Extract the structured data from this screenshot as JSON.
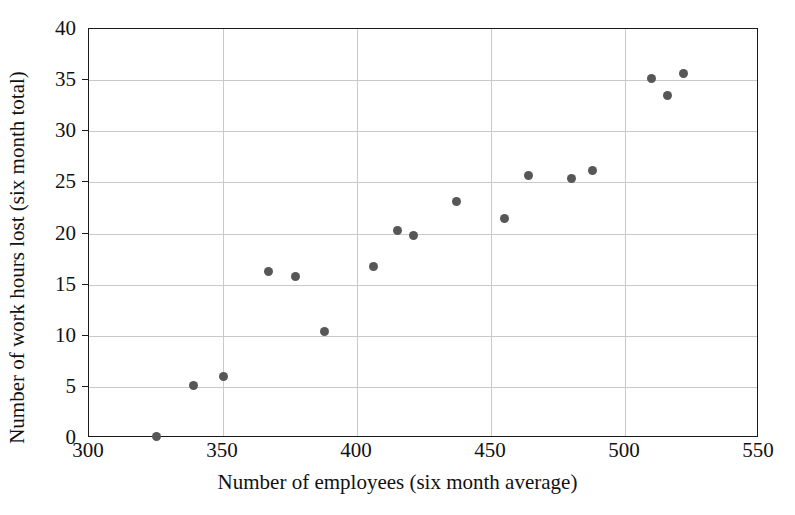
{
  "chart_data": {
    "type": "scatter",
    "title": "",
    "xlabel": "Number of employees (six month average)",
    "ylabel": "Number of work hours lost (six month total)",
    "xlim": [
      300,
      550
    ],
    "ylim": [
      0,
      40
    ],
    "xticks": [
      300,
      350,
      400,
      450,
      500,
      550
    ],
    "yticks": [
      0,
      5,
      10,
      15,
      20,
      25,
      30,
      35,
      40
    ],
    "grid": true,
    "legend": null,
    "marker_color": "#575757",
    "axis_color": "#1a1a1a",
    "grid_color": "#c9c9c9",
    "n_points": 17,
    "x": [
      325,
      339,
      350,
      367,
      377,
      388,
      406,
      415,
      421,
      437,
      455,
      464,
      480,
      488,
      510,
      516,
      522
    ],
    "y": [
      0.1,
      5.1,
      6.0,
      16.3,
      15.8,
      10.4,
      16.8,
      20.3,
      19.8,
      23.1,
      21.5,
      25.7,
      25.4,
      26.2,
      35.2,
      33.5,
      35.6
    ],
    "points": [
      {
        "x": 325,
        "y": 0.1
      },
      {
        "x": 339,
        "y": 5.1
      },
      {
        "x": 350,
        "y": 6.0
      },
      {
        "x": 367,
        "y": 16.3
      },
      {
        "x": 377,
        "y": 15.8
      },
      {
        "x": 388,
        "y": 10.4
      },
      {
        "x": 406,
        "y": 16.8
      },
      {
        "x": 415,
        "y": 20.3
      },
      {
        "x": 421,
        "y": 19.8
      },
      {
        "x": 437,
        "y": 23.1
      },
      {
        "x": 455,
        "y": 21.5
      },
      {
        "x": 464,
        "y": 25.7
      },
      {
        "x": 480,
        "y": 25.4
      },
      {
        "x": 488,
        "y": 26.2
      },
      {
        "x": 510,
        "y": 35.2
      },
      {
        "x": 516,
        "y": 33.5
      },
      {
        "x": 522,
        "y": 35.6
      }
    ]
  }
}
